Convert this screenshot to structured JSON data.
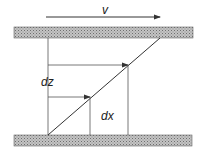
{
  "diagram": {
    "labels": {
      "velocity": "v",
      "dz": "dz",
      "dx": "dx"
    },
    "colors": {
      "line": "#333333",
      "plate_fill": "#b8b8b8",
      "plate_dot": "#7a7a7a",
      "background": "#ffffff"
    },
    "elements": [
      {
        "id": "top-plate",
        "type": "hatched-plate"
      },
      {
        "id": "bottom-plate",
        "type": "hatched-plate"
      },
      {
        "id": "velocity-arrow",
        "type": "arrow",
        "label": "v"
      },
      {
        "id": "shear-line",
        "type": "diagonal"
      },
      {
        "id": "upper-displacement-arrow",
        "type": "arrow"
      },
      {
        "id": "lower-displacement-arrow",
        "type": "arrow",
        "label_dz": "dz",
        "label_dx": "dx"
      }
    ]
  }
}
